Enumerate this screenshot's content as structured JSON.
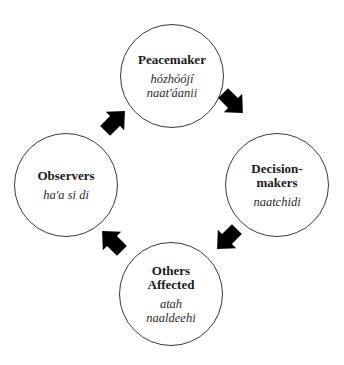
{
  "diagram": {
    "type": "cycle",
    "nodes": [
      {
        "id": "top",
        "title": "Peacemaker",
        "title_line1": "Peacemaker",
        "title_line2": "",
        "native_line1": "hózhóójí",
        "native_line2": "naat'áanii"
      },
      {
        "id": "right",
        "title": "Decision-makers",
        "title_line1": "Decision-",
        "title_line2": "makers",
        "native_line1": "naatchidi",
        "native_line2": ""
      },
      {
        "id": "bottom",
        "title": "Others Affected",
        "title_line1": "Others",
        "title_line2": "Affected",
        "native_line1": "atah",
        "native_line2": "naaldeehi"
      },
      {
        "id": "left",
        "title": "Observers",
        "title_line1": "Observers",
        "title_line2": "",
        "native_line1": "ha'a si di",
        "native_line2": ""
      }
    ],
    "edges": [
      {
        "from": "top",
        "to": "right",
        "direction": "clockwise"
      },
      {
        "from": "right",
        "to": "bottom",
        "direction": "clockwise"
      },
      {
        "from": "bottom",
        "to": "left",
        "direction": "clockwise"
      },
      {
        "from": "left",
        "to": "top",
        "direction": "clockwise"
      }
    ],
    "colors": {
      "circle_stroke": "#3a3a3a",
      "arrow_fill": "#000000",
      "background": "#ffffff"
    },
    "icons": {
      "arrow": "block-arrow-icon"
    }
  }
}
